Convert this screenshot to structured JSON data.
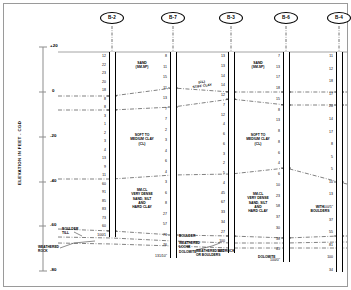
{
  "drawing": {
    "type": "geotechnical-subsurface-profile",
    "axis": {
      "title": "ELEVATION IN FEET - CGD",
      "ticks": [
        "+20",
        "0",
        "-20",
        "-40",
        "-60",
        "-80"
      ],
      "tick_values": [
        20,
        0,
        -20,
        -40,
        -60,
        -80
      ],
      "range": [
        -80,
        20
      ]
    },
    "ground_line_elevation": "+15",
    "boreholes": [
      {
        "id": "B-2",
        "x": 112,
        "top_y": 52,
        "bottom_y": 237,
        "blows": [
          "12",
          "22",
          "23",
          "20",
          "18",
          "8",
          "8",
          "3",
          "1",
          "2",
          "3",
          "4",
          "13",
          "9",
          "11",
          "60",
          "91",
          "85",
          "83",
          "73",
          "60",
          "100/1"
        ],
        "blow_side": "left"
      },
      {
        "id": "B-7",
        "x": 173,
        "top_y": 52,
        "bottom_y": 258,
        "blows": [
          "8",
          "11",
          "15",
          "11",
          "13",
          "7",
          "7",
          "2",
          "3",
          "4",
          "6",
          "4",
          "3",
          "6",
          "8",
          "27",
          "57",
          "73",
          "76",
          "131/10\""
        ],
        "blow_side": "left"
      },
      {
        "id": "B-3",
        "x": 231,
        "top_y": 52,
        "bottom_y": 253,
        "blows": [
          "13",
          "13",
          "14",
          "14",
          "12",
          "7",
          "12",
          "4",
          "6",
          "6",
          "3",
          "2",
          "5",
          "4",
          "45",
          "67",
          "33",
          "34",
          "27",
          "100",
          "50/3\""
        ],
        "blow_side": "left"
      },
      {
        "id": "B-6",
        "x": 286,
        "top_y": 52,
        "bottom_y": 262,
        "blows": [
          "7",
          "13",
          "17",
          "18",
          "15",
          "8",
          "13",
          "8",
          "8",
          "6",
          "4",
          "6",
          "10",
          "23",
          "58",
          "37",
          "30",
          "38",
          "45",
          "100/0\""
        ],
        "blow_side": "left"
      },
      {
        "id": "B-4",
        "x": 339,
        "top_y": 52,
        "bottom_y": 272,
        "blows": [
          "11",
          "12",
          "18",
          "17",
          "20",
          "14",
          "17",
          "8",
          "5",
          "5",
          "10",
          "13",
          "100/5\"",
          "37",
          "55",
          "81",
          "100",
          "34"
        ],
        "blow_side": "left"
      }
    ],
    "soil_labels": [
      {
        "text": "SAND\n(SM-SP)",
        "x": 142,
        "y": 61
      },
      {
        "text": "(CL)\nSTIFF CLAY",
        "x": 202,
        "y": 80,
        "rotate": -8
      },
      {
        "text": "SAND\n(SM-SP)",
        "x": 258,
        "y": 61
      },
      {
        "text": "SOFT TO\nMEDIUM CLAY\n(CL)",
        "x": 142,
        "y": 133
      },
      {
        "text": "SOFT TO\nMEDIUM CLAY\n(CL)",
        "x": 258,
        "y": 133
      },
      {
        "text": "SM-CL\nVERY DENSE\nSAND, SILT\nAND\nHARD CLAY",
        "x": 142,
        "y": 188
      },
      {
        "text": "SM-CL\nVERY DENSE\nSAND, SILT\nAND\nHARD CLAY",
        "x": 258,
        "y": 192
      },
      {
        "text": "WITH\nBOULDERS",
        "x": 320,
        "y": 205
      }
    ],
    "annotations": [
      {
        "text": "BOULDER\nTILL",
        "x": 62,
        "y": 227
      },
      {
        "text": "WEATHERED\nROCK",
        "x": 38,
        "y": 245
      },
      {
        "text": "BOULDER",
        "x": 179,
        "y": 234
      },
      {
        "text": "WEATHERED",
        "x": 179,
        "y": 241
      },
      {
        "text": "LOOSE",
        "x": 179,
        "y": 245
      },
      {
        "text": "DOLOMITE",
        "x": 179,
        "y": 250
      },
      {
        "text": "WEATHERED BEDROCK\nOR BOULDERS",
        "x": 196,
        "y": 249
      },
      {
        "text": "DOLOMITE",
        "x": 258,
        "y": 255
      }
    ]
  }
}
